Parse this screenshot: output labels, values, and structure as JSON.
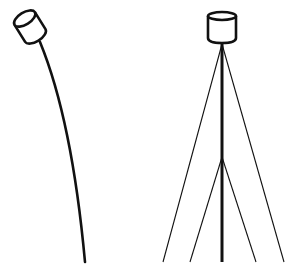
{
  "figure": {
    "stroke_color": "#111111",
    "background": "#ffffff",
    "left_figure": {
      "label": "bending-pole-with-tilted-head",
      "head": {
        "cx": 30,
        "cy": 27,
        "rx": 12,
        "ry": 6,
        "height": 20,
        "rotation": -32
      },
      "rod_path": "M 40 42 Q 72 120 85 262"
    },
    "right_figure": {
      "label": "guyed-pole-with-upright-head",
      "head": {
        "cx": 222,
        "top": 16,
        "rx": 14,
        "ry": 4,
        "bottom": 41
      },
      "pole": {
        "x": 222,
        "y1": 43,
        "y2": 262
      },
      "outer_guys": [
        {
          "x1": 222,
          "y1": 44,
          "x2": 163,
          "y2": 262
        },
        {
          "x1": 222,
          "y1": 44,
          "x2": 284,
          "y2": 262
        }
      ],
      "inner_guys": [
        {
          "x1": 222,
          "y1": 157,
          "x2": 190,
          "y2": 262
        },
        {
          "x1": 222,
          "y1": 157,
          "x2": 256,
          "y2": 262
        }
      ]
    }
  }
}
